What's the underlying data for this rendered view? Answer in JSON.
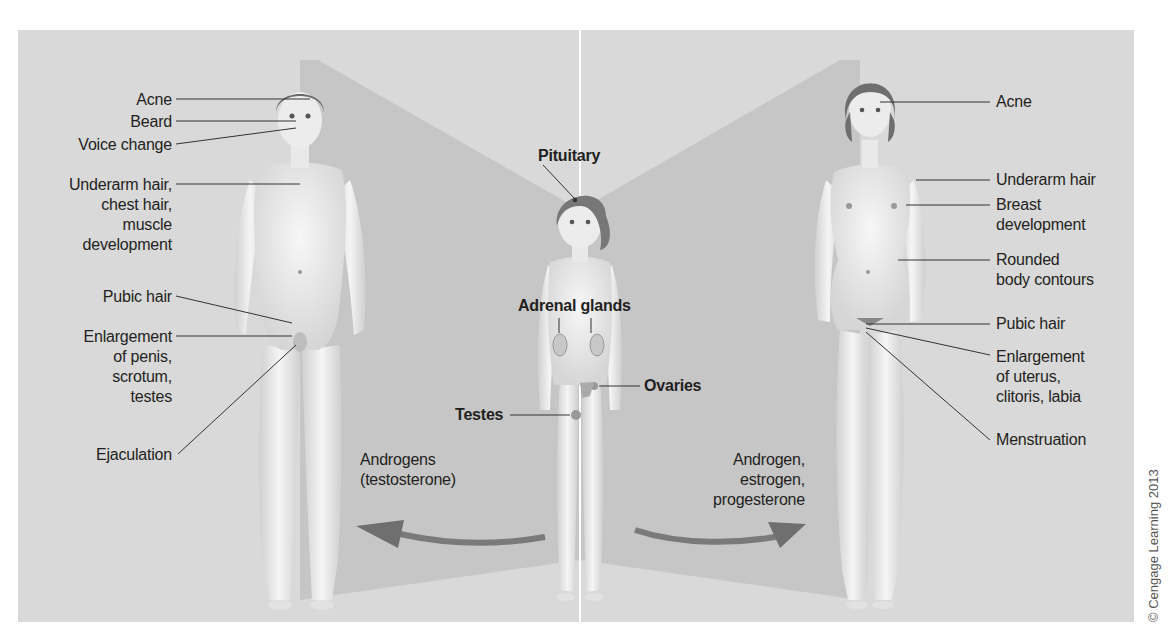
{
  "figure": {
    "male_labels": [
      {
        "id": "acne",
        "text": "Acne"
      },
      {
        "id": "beard",
        "text": "Beard"
      },
      {
        "id": "voice",
        "text": "Voice change"
      },
      {
        "id": "underarm",
        "lines": [
          "Underarm hair,",
          "chest hair,",
          "muscle",
          "development"
        ]
      },
      {
        "id": "pubic",
        "text": "Pubic hair"
      },
      {
        "id": "enlargement",
        "lines": [
          "Enlargement",
          "of penis,",
          "scrotum,",
          "testes"
        ]
      },
      {
        "id": "ejaculation",
        "text": "Ejaculation"
      }
    ],
    "child_labels": {
      "pituitary": "Pituitary",
      "adrenal": "Adrenal glands",
      "ovaries": "Ovaries",
      "testes": "Testes"
    },
    "female_labels": [
      {
        "id": "acne",
        "text": "Acne"
      },
      {
        "id": "underarm",
        "text": "Underarm hair"
      },
      {
        "id": "breast",
        "lines": [
          "Breast",
          "development"
        ]
      },
      {
        "id": "rounded",
        "lines": [
          "Rounded",
          "body contours"
        ]
      },
      {
        "id": "pubic",
        "text": "Pubic hair"
      },
      {
        "id": "enlargement",
        "lines": [
          "Enlargement",
          "of uterus,",
          "clitoris, labia"
        ]
      },
      {
        "id": "menstruation",
        "text": "Menstruation"
      }
    ],
    "hormones": {
      "male": [
        "Androgens",
        "(testosterone)"
      ],
      "female": [
        "Androgen,",
        "estrogen,",
        "progesterone"
      ]
    },
    "copyright": "© Cengage Learning 2013",
    "colors": {
      "panel_bg": "#d9d9d9",
      "shadow": "#c4c4c4",
      "skin": "#efefef",
      "hair": "#6a6a6a",
      "arrow": "#7a7a7a",
      "leader": "#333333"
    }
  }
}
